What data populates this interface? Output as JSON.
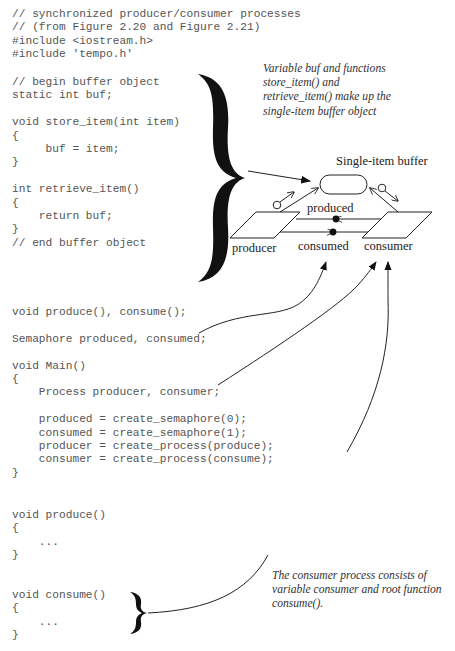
{
  "code_blocks": {
    "header": [
      "// synchronized producer/consumer processes",
      "// (from Figure 2.20 and Figure 2.21)",
      "#include <iostream.h>",
      "#include 'tempo.h'"
    ],
    "buffer_object": [
      "// begin buffer object",
      "static int buf;",
      "",
      "void store_item(int item)",
      "{",
      "     buf = item;",
      "}",
      "",
      "int retrieve_item()",
      "{",
      "    return buf;",
      "}",
      "// end buffer object"
    ],
    "declarations": [
      "void produce(), consume();",
      "",
      "Semaphore produced, consumed;",
      "",
      "void Main()",
      "{",
      "    Process producer, consumer;",
      "",
      "    produced = create_semaphore(0);",
      "    consumed = create_semaphore(1);",
      "    producer = create_process(produce);",
      "    consumer = create_process(consume);",
      "}"
    ],
    "produce_fn": [
      "void produce()",
      "{",
      "    ...",
      "}"
    ],
    "consume_fn": [
      "void consume()",
      "{",
      "    ...",
      "}"
    ]
  },
  "annotations": {
    "buffer_note": [
      "Variable buf and functions",
      "store_item() and",
      "retrieve_item() make up the",
      "single-item buffer object"
    ],
    "consumer_note": [
      "The consumer process consists of",
      "variable consumer and root function",
      "consume()."
    ]
  },
  "diagram": {
    "title": "Single-item buffer",
    "labels": {
      "producer": "producer",
      "produced": "produced",
      "consumed": "consumed",
      "consumer": "consumer"
    }
  },
  "colors": {
    "code_text": "#555555",
    "note_text": "#333333",
    "lines": "#222222",
    "brace": "#111111"
  }
}
